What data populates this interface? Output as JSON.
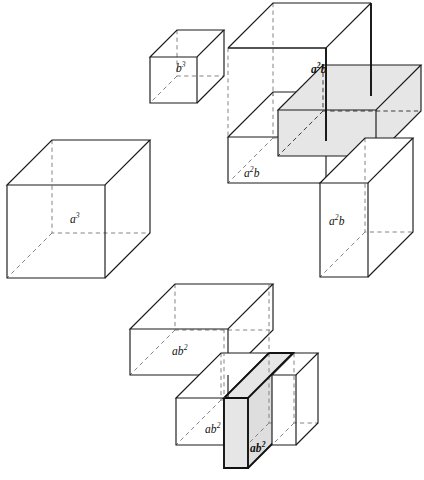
{
  "figure": {
    "type": "geometric-diagram",
    "background_color": "#ffffff",
    "line_color": "#1a1a1a",
    "dashed_line_color": "#7c7c7c",
    "shaded_face_color": "#e6e6e6"
  },
  "groups": [
    {
      "id": "group-a3",
      "name": "a-cubed-solid",
      "term": "a^3",
      "count": 1,
      "shaded": false,
      "labels": [
        {
          "id": "label-a3",
          "base": "a",
          "exponent": "3",
          "bold": false,
          "x": 70,
          "y": 214
        }
      ]
    },
    {
      "id": "group-b3",
      "name": "b-cubed-solid",
      "term": "b^3",
      "count": 1,
      "shaded": false,
      "labels": [
        {
          "id": "label-b3",
          "base": "b",
          "exponent": "3",
          "bold": false,
          "x": 176,
          "y": 63
        }
      ]
    },
    {
      "id": "group-a2b",
      "name": "a-squared-b-solids",
      "term": "a^2 b",
      "count": 3,
      "shaded": true,
      "labels": [
        {
          "id": "label-a2b-top",
          "base": "a",
          "exponent": "2",
          "suffix": "b",
          "bold": true,
          "x": 311,
          "y": 64
        },
        {
          "id": "label-a2b-left",
          "base": "a",
          "exponent": "2",
          "suffix": "b",
          "bold": false,
          "x": 244,
          "y": 168
        },
        {
          "id": "label-a2b-front",
          "base": "a",
          "exponent": "2",
          "suffix": "b",
          "bold": false,
          "x": 329,
          "y": 216
        }
      ]
    },
    {
      "id": "group-ab2",
      "name": "a-b-squared-solids",
      "term": "a b^2",
      "count": 3,
      "shaded": true,
      "labels": [
        {
          "id": "label-ab2-top",
          "base": "a",
          "suffix": "b",
          "exponent": "2",
          "bold": false,
          "x": 172,
          "y": 346
        },
        {
          "id": "label-ab2-front",
          "base": "a",
          "suffix": "b",
          "exponent": "2",
          "bold": false,
          "x": 205,
          "y": 424
        },
        {
          "id": "label-ab2-right",
          "base": "a",
          "suffix": "b",
          "exponent": "2",
          "bold": true,
          "x": 250,
          "y": 443
        }
      ]
    }
  ],
  "labels_flat": [
    {
      "key": "a3",
      "text_base": "a",
      "text_exp": "3",
      "text_suffix": "",
      "bold": false,
      "x": 70,
      "y": 214
    },
    {
      "key": "b3",
      "text_base": "b",
      "text_exp": "3",
      "text_suffix": "",
      "bold": false,
      "x": 176,
      "y": 63
    },
    {
      "key": "a2b_top",
      "text_base": "a",
      "text_exp": "2",
      "text_suffix": "b",
      "bold": true,
      "x": 311,
      "y": 64
    },
    {
      "key": "a2b_left",
      "text_base": "a",
      "text_exp": "2",
      "text_suffix": "b",
      "bold": false,
      "x": 244,
      "y": 168
    },
    {
      "key": "a2b_front",
      "text_base": "a",
      "text_exp": "2",
      "text_suffix": "b",
      "bold": false,
      "x": 329,
      "y": 216
    },
    {
      "key": "ab2_top",
      "text_base": "ab",
      "text_exp": "2",
      "text_suffix": "",
      "bold": false,
      "x": 172,
      "y": 346
    },
    {
      "key": "ab2_front",
      "text_base": "ab",
      "text_exp": "2",
      "text_suffix": "",
      "bold": false,
      "x": 205,
      "y": 424
    },
    {
      "key": "ab2_right",
      "text_base": "ab",
      "text_exp": "2",
      "text_suffix": "",
      "bold": true,
      "x": 250,
      "y": 443
    }
  ]
}
